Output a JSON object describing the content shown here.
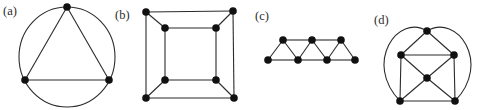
{
  "figure": {
    "background": "#ffffff",
    "ink_color": "#2b2b2b",
    "vertex_color": "#111111",
    "vertex_radius": 3.8,
    "edge_width": 1.1,
    "label_font_size": 12.5,
    "width": 478,
    "height": 110,
    "panels": [
      {
        "label": "(a)",
        "label_x": 3,
        "label_y": 15,
        "description": "triangle on 3 vertices inscribed in a circle",
        "vertices": [
          [
            67,
            7
          ],
          [
            25,
            80
          ],
          [
            109,
            80
          ]
        ],
        "edges": [
          [
            0,
            1
          ],
          [
            1,
            2
          ],
          [
            2,
            0
          ]
        ],
        "ellipses": [
          {
            "cx": 67,
            "cy": 57,
            "rx": 48,
            "ry": 50
          }
        ]
      },
      {
        "label": "(b)",
        "label_x": 115,
        "label_y": 19,
        "description": "cube graph: outer square and inner square joined at corresponding corners",
        "vertices": [
          [
            146,
            12
          ],
          [
            233,
            11
          ],
          [
            234,
            98
          ],
          [
            146,
            98
          ],
          [
            165,
            28
          ],
          [
            216,
            28
          ],
          [
            216,
            80
          ],
          [
            165,
            80
          ]
        ],
        "edges": [
          [
            0,
            1
          ],
          [
            1,
            2
          ],
          [
            2,
            3
          ],
          [
            3,
            0
          ],
          [
            4,
            5
          ],
          [
            5,
            6
          ],
          [
            6,
            7
          ],
          [
            7,
            4
          ],
          [
            0,
            4
          ],
          [
            1,
            5
          ],
          [
            2,
            6
          ],
          [
            3,
            7
          ]
        ]
      },
      {
        "label": "(c)",
        "label_x": 255,
        "label_y": 20,
        "description": "horizontal strip of alternating triangles: 4 bottom vertices, 3 top vertices",
        "vertices": [
          [
            268,
            60
          ],
          [
            298,
            60
          ],
          [
            327,
            60
          ],
          [
            355,
            60
          ],
          [
            283,
            40
          ],
          [
            312,
            40
          ],
          [
            341,
            40
          ]
        ],
        "edges": [
          [
            0,
            1
          ],
          [
            1,
            2
          ],
          [
            2,
            3
          ],
          [
            4,
            5
          ],
          [
            5,
            6
          ],
          [
            0,
            4
          ],
          [
            4,
            1
          ],
          [
            1,
            5
          ],
          [
            5,
            2
          ],
          [
            2,
            6
          ],
          [
            6,
            3
          ]
        ]
      },
      {
        "label": "(d)",
        "label_x": 374,
        "label_y": 24,
        "description": "octahedron: square with centre vertex, apex joined to bottom corners by outer arcs",
        "vertices": [
          [
            427,
            31
          ],
          [
            401,
            55
          ],
          [
            454,
            55
          ],
          [
            427,
            78
          ],
          [
            400,
            101
          ],
          [
            455,
            101
          ]
        ],
        "edges": [
          [
            0,
            1
          ],
          [
            0,
            2
          ],
          [
            1,
            2
          ],
          [
            1,
            3
          ],
          [
            2,
            3
          ],
          [
            1,
            4
          ],
          [
            2,
            5
          ],
          [
            3,
            4
          ],
          [
            3,
            5
          ],
          [
            4,
            5
          ]
        ],
        "curves": [
          {
            "from": 0,
            "to": 4,
            "c1": [
              398,
              13
            ],
            "c2": [
              363,
              63
            ]
          },
          {
            "from": 0,
            "to": 5,
            "c1": [
              457,
              13
            ],
            "c2": [
              492,
              63
            ]
          }
        ]
      }
    ]
  }
}
